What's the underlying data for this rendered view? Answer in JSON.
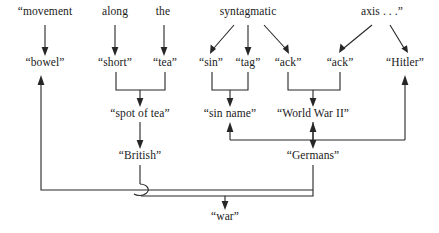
{
  "figure": {
    "type": "linguistic-derivation-diagram",
    "background_color": "#ffffff",
    "ink_color": "#262626",
    "width": 439,
    "height": 233
  },
  "rows": {
    "row1_label": "source phrase (top row)",
    "row2_label": "word fragments (second row)",
    "row3_label": "phrases (third row)",
    "row4_label": "nationalities (fourth row)",
    "row5_label": "result (bottom row)"
  },
  "nodes": {
    "movement": {
      "text": "“movement",
      "x": 45,
      "y": 12,
      "row": 1
    },
    "along": {
      "text": "along",
      "x": 115,
      "y": 12,
      "row": 1
    },
    "the": {
      "text": "the",
      "x": 163,
      "y": 12,
      "row": 1
    },
    "syntagmatic": {
      "text": "syntagmatic",
      "x": 248,
      "y": 12,
      "row": 1
    },
    "axis": {
      "text": "axis . . .”",
      "x": 382,
      "y": 12,
      "row": 1
    },
    "bowel": {
      "text": "“bowel”",
      "x": 45,
      "y": 62,
      "row": 2
    },
    "short": {
      "text": "“short”",
      "x": 115,
      "y": 62,
      "row": 2
    },
    "tea": {
      "text": "“tea”",
      "x": 165,
      "y": 62,
      "row": 2
    },
    "sin": {
      "text": "“sin”",
      "x": 211,
      "y": 62,
      "row": 2
    },
    "tag": {
      "text": "“tag”",
      "x": 248,
      "y": 62,
      "row": 2
    },
    "ack1": {
      "text": "“ack”",
      "x": 288,
      "y": 62,
      "row": 2
    },
    "ack2": {
      "text": "“ack”",
      "x": 340,
      "y": 62,
      "row": 2
    },
    "hitler": {
      "text": "“Hitler”",
      "x": 405,
      "y": 62,
      "row": 2
    },
    "spot_of_tea": {
      "text": "“spot of tea”",
      "x": 140,
      "y": 113,
      "row": 3
    },
    "sin_name": {
      "text": "“sin name”",
      "x": 230,
      "y": 113,
      "row": 3
    },
    "world_war_ii": {
      "text": "“World War II”",
      "x": 313,
      "y": 113,
      "row": 3
    },
    "british": {
      "text": "“British”",
      "x": 140,
      "y": 155,
      "row": 4
    },
    "germans": {
      "text": "“Germans”",
      "x": 313,
      "y": 155,
      "row": 4
    },
    "war": {
      "text": "“war”",
      "x": 225,
      "y": 212,
      "row": 5
    }
  },
  "edges": [
    {
      "from": "movement",
      "to": "bowel",
      "kind": "vertical-arrow"
    },
    {
      "from": "along",
      "to": "short",
      "kind": "vertical-arrow"
    },
    {
      "from": "the",
      "to": "tea",
      "kind": "vertical-arrow"
    },
    {
      "from": "syntagmatic",
      "to": "sin",
      "kind": "diagonal-arrow"
    },
    {
      "from": "syntagmatic",
      "to": "tag",
      "kind": "vertical-arrow"
    },
    {
      "from": "syntagmatic",
      "to": "ack1",
      "kind": "diagonal-arrow"
    },
    {
      "from": "axis",
      "to": "ack2",
      "kind": "diagonal-arrow"
    },
    {
      "from": "axis",
      "to": "hitler",
      "kind": "diagonal-arrow"
    },
    {
      "from": "short+tea",
      "to": "spot_of_tea",
      "kind": "bracket-merge-arrow"
    },
    {
      "from": "sin+tag",
      "to": "sin_name",
      "kind": "bracket-merge-arrow"
    },
    {
      "from": "ack1+ack2",
      "to": "world_war_ii",
      "kind": "bracket-merge-arrow"
    },
    {
      "from": "spot_of_tea",
      "to": "british",
      "kind": "vertical-arrow"
    },
    {
      "from": "world_war_ii",
      "to": "germans",
      "kind": "vertical-arrow"
    },
    {
      "from": "hitler",
      "to": "sin_name",
      "kind": "routed-arrow"
    },
    {
      "from": "hitler",
      "to": "world_war_ii",
      "kind": "routed-arrow"
    },
    {
      "from": "british+germans",
      "to": "war",
      "kind": "routed-merge-arrow"
    },
    {
      "from": "war-loop",
      "to": "bowel",
      "kind": "routed-arrow"
    }
  ]
}
